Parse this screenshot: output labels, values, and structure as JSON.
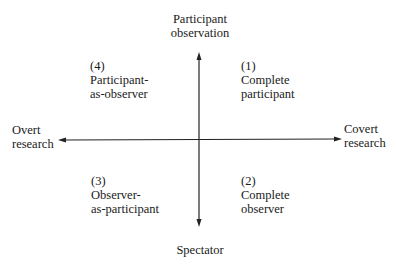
{
  "diagram": {
    "type": "quadrant",
    "vertical_axis": {
      "top_label": [
        "Participant",
        "observation"
      ],
      "bottom_label": [
        "Spectator"
      ]
    },
    "horizontal_axis": {
      "left_label": [
        "Overt",
        "research"
      ],
      "right_label": [
        "Covert",
        "research"
      ]
    },
    "quadrants": {
      "top_right": {
        "number": "(1)",
        "lines": [
          "Complete",
          "participant"
        ]
      },
      "bottom_right": {
        "number": "(2)",
        "lines": [
          "Complete",
          "observer"
        ]
      },
      "bottom_left": {
        "number": "(3)",
        "lines": [
          "Observer-",
          "as-participant"
        ]
      },
      "top_left": {
        "number": "(4)",
        "lines": [
          "Participant-",
          "as-observer"
        ]
      }
    },
    "colors": {
      "line": "#222222",
      "text": "#1a1a1a",
      "background": "#ffffff"
    }
  }
}
